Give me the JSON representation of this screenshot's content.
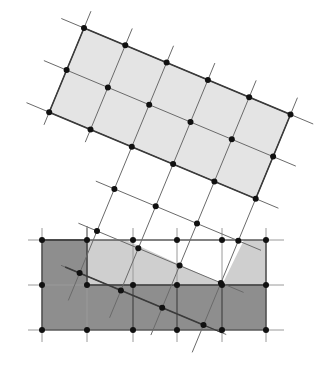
{
  "diagram": {
    "colors": {
      "background": "#ffffff",
      "rotated_fill": "#e4e4e4",
      "dark_fill": "#8e8e8e",
      "light_fill": "#cfcfcf",
      "line": "#3a3a3a",
      "thin_line": "#6a6a6a",
      "guide_line": "#9a9a9a",
      "node": "#111111"
    },
    "rotated_lattice": {
      "origin": [
        84,
        28
      ],
      "u": [
        41.3,
        17.3
      ],
      "v": [
        -17.4,
        42.1
      ],
      "shaded_cells": {
        "i_range": [
          0,
          5
        ],
        "j_range": [
          0,
          2
        ]
      },
      "nodes_rows": [
        [
          [
            0,
            0
          ],
          [
            1,
            0
          ],
          [
            2,
            0
          ],
          [
            3,
            0
          ],
          [
            4,
            0
          ],
          [
            5,
            0
          ]
        ],
        [
          [
            0,
            1
          ],
          [
            1,
            1
          ],
          [
            2,
            1
          ],
          [
            3,
            1
          ],
          [
            4,
            1
          ],
          [
            5,
            1
          ]
        ],
        [
          [
            0,
            2
          ],
          [
            1,
            2
          ],
          [
            2,
            2
          ],
          [
            3,
            2
          ],
          [
            4,
            2
          ],
          [
            5,
            2
          ]
        ],
        [
          [
            2,
            3
          ],
          [
            3,
            3
          ],
          [
            4,
            3
          ],
          [
            5,
            3
          ]
        ],
        [
          [
            2,
            4
          ],
          [
            3,
            4
          ],
          [
            4,
            4
          ],
          [
            5,
            4
          ]
        ],
        [
          [
            2,
            5
          ],
          [
            3,
            5
          ],
          [
            4,
            5
          ],
          [
            5,
            5
          ]
        ]
      ]
    },
    "axis_lattice": {
      "xs": [
        42,
        87,
        133,
        177,
        222,
        266
      ],
      "ys": [
        240,
        285,
        330
      ]
    },
    "polygons": {
      "dark_region": [
        [
          42,
          240
        ],
        [
          87,
          240
        ],
        [
          87,
          285
        ],
        [
          222,
          285
        ],
        [
          266,
          285
        ],
        [
          266,
          330
        ],
        [
          42,
          330
        ]
      ],
      "light_left": [
        [
          87,
          240
        ],
        [
          126,
          240
        ],
        [
          222,
          284
        ],
        [
          87,
          285
        ]
      ],
      "light_right": [
        [
          244,
          240
        ],
        [
          266,
          240
        ],
        [
          266,
          285
        ],
        [
          222,
          285
        ]
      ]
    }
  }
}
